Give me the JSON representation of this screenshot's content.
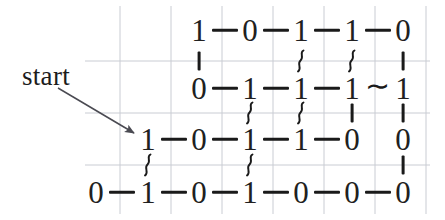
{
  "figure": {
    "background_color": "#ffffff",
    "grid_color": "#c9ccd3",
    "ink_color": "#202020",
    "annotation": {
      "label": "start",
      "arrow": {
        "from_x": 58,
        "from_y": 88,
        "to_x": 134,
        "to_y": 133
      }
    },
    "geometry": {
      "col_x": [
        96,
        148,
        199,
        250,
        301,
        352,
        403
      ],
      "row_y": [
        30,
        88,
        139,
        192
      ],
      "grid_vertical_x": [
        120,
        171,
        222,
        273,
        324,
        375,
        426
      ],
      "grid_horizontal_y": [
        61,
        113,
        165
      ],
      "grid_h_x_start": 85,
      "grid_h_x_end": 430,
      "grid_v_y_start": 6,
      "grid_v_y_end": 214
    }
  },
  "chart_data": {
    "type": "diagram",
    "title": "",
    "rows": [
      {
        "index": 0,
        "y": 30,
        "cells": [
          {
            "col": 2,
            "value": "1"
          },
          {
            "col": 3,
            "value": "0"
          },
          {
            "col": 4,
            "value": "1"
          },
          {
            "col": 5,
            "value": "1"
          },
          {
            "col": 6,
            "value": "0"
          }
        ],
        "h_bonds": [
          {
            "between": [
              2,
              3
            ],
            "kind": "dash"
          },
          {
            "between": [
              3,
              4
            ],
            "kind": "dash"
          },
          {
            "between": [
              4,
              5
            ],
            "kind": "dash"
          },
          {
            "between": [
              5,
              6
            ],
            "kind": "dash"
          }
        ]
      },
      {
        "index": 1,
        "y": 88,
        "cells": [
          {
            "col": 2,
            "value": "0"
          },
          {
            "col": 3,
            "value": "1"
          },
          {
            "col": 4,
            "value": "1"
          },
          {
            "col": 5,
            "value": "1"
          },
          {
            "col": 6,
            "value": "1"
          }
        ],
        "h_bonds": [
          {
            "between": [
              2,
              3
            ],
            "kind": "dash"
          },
          {
            "between": [
              3,
              4
            ],
            "kind": "dash"
          },
          {
            "between": [
              4,
              5
            ],
            "kind": "dash"
          },
          {
            "between": [
              5,
              6
            ],
            "kind": "tilde"
          }
        ]
      },
      {
        "index": 2,
        "y": 139,
        "cells": [
          {
            "col": 1,
            "value": "1"
          },
          {
            "col": 2,
            "value": "0"
          },
          {
            "col": 3,
            "value": "1"
          },
          {
            "col": 4,
            "value": "1"
          },
          {
            "col": 5,
            "value": "0"
          },
          {
            "col": 6,
            "value": "0"
          }
        ],
        "h_bonds": [
          {
            "between": [
              1,
              2
            ],
            "kind": "dash"
          },
          {
            "between": [
              2,
              3
            ],
            "kind": "dash"
          },
          {
            "between": [
              3,
              4
            ],
            "kind": "dash"
          },
          {
            "between": [
              4,
              5
            ],
            "kind": "dash"
          }
        ]
      },
      {
        "index": 3,
        "y": 192,
        "cells": [
          {
            "col": 0,
            "value": "0"
          },
          {
            "col": 1,
            "value": "1"
          },
          {
            "col": 2,
            "value": "0"
          },
          {
            "col": 3,
            "value": "1"
          },
          {
            "col": 4,
            "value": "0"
          },
          {
            "col": 5,
            "value": "0"
          },
          {
            "col": 6,
            "value": "0"
          }
        ],
        "h_bonds": [
          {
            "between": [
              0,
              1
            ],
            "kind": "dash"
          },
          {
            "between": [
              1,
              2
            ],
            "kind": "dash"
          },
          {
            "between": [
              2,
              3
            ],
            "kind": "dash"
          },
          {
            "between": [
              3,
              4
            ],
            "kind": "dash"
          },
          {
            "between": [
              4,
              5
            ],
            "kind": "dash"
          },
          {
            "between": [
              5,
              6
            ],
            "kind": "dash"
          }
        ]
      }
    ],
    "v_bonds": [
      {
        "col": 2,
        "between_rows": [
          0,
          1
        ],
        "kind": "bar",
        "y": 61
      },
      {
        "col": 4,
        "between_rows": [
          0,
          1
        ],
        "kind": "squiggle",
        "y": 61
      },
      {
        "col": 5,
        "between_rows": [
          0,
          1
        ],
        "kind": "squiggle",
        "y": 61
      },
      {
        "col": 6,
        "between_rows": [
          0,
          1
        ],
        "kind": "bar",
        "y": 61
      },
      {
        "col": 3,
        "between_rows": [
          1,
          2
        ],
        "kind": "squiggle",
        "y": 113
      },
      {
        "col": 4,
        "between_rows": [
          1,
          2
        ],
        "kind": "squiggle",
        "y": 113
      },
      {
        "col": 5,
        "between_rows": [
          1,
          2
        ],
        "kind": "bar",
        "y": 113
      },
      {
        "col": 6,
        "between_rows": [
          1,
          2
        ],
        "kind": "bar",
        "y": 113
      },
      {
        "col": 1,
        "between_rows": [
          2,
          3
        ],
        "kind": "squiggle",
        "y": 165
      },
      {
        "col": 3,
        "between_rows": [
          2,
          3
        ],
        "kind": "squiggle",
        "y": 165
      },
      {
        "col": 6,
        "between_rows": [
          2,
          3
        ],
        "kind": "bar",
        "y": 165
      }
    ]
  }
}
